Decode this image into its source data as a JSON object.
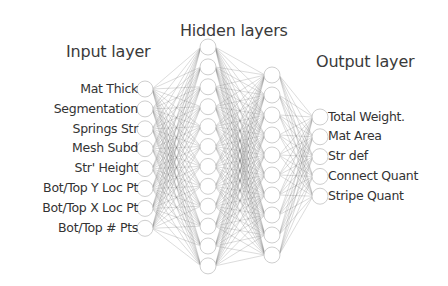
{
  "titles": {
    "input": "Input layer",
    "hidden": "Hidden layers",
    "output": "Output layer"
  },
  "inputs": [
    {
      "label": "Mat Thick"
    },
    {
      "label": "Segmentation"
    },
    {
      "label": "Springs Str"
    },
    {
      "label": "Mesh Subd"
    },
    {
      "label": "Str' Height"
    },
    {
      "label": "Bot/Top Y Loc Pt"
    },
    {
      "label": "Bot/Top X Loc Pt"
    },
    {
      "label": "Bot/Top # Pts"
    }
  ],
  "outputs": [
    {
      "label": "Total Weight."
    },
    {
      "label": "Mat Area"
    },
    {
      "label": "Str def"
    },
    {
      "label": "Connect Quant"
    },
    {
      "label": "Stripe Quant"
    }
  ],
  "layers": {
    "input": {
      "x": 145,
      "count": 8,
      "y0": 89,
      "dy": 19.9
    },
    "hidden1": {
      "x": 208,
      "count": 12,
      "y0": 47,
      "dy": 19.9
    },
    "hidden2": {
      "x": 272,
      "count": 10,
      "y0": 75,
      "dy": 20
    },
    "output": {
      "x": 320,
      "count": 5,
      "y0": 117,
      "dy": 19.8
    }
  },
  "style": {
    "node_radius": 8,
    "node_stroke": "#c8c8c8",
    "edge_color": "#6e6e6e",
    "text_color": "#333333"
  }
}
